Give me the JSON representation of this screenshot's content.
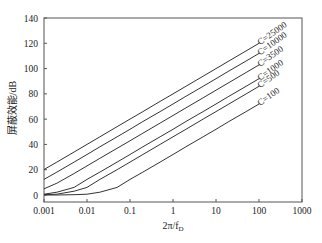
{
  "chart_data": {
    "type": "line",
    "title": "",
    "xlabel": "2π/f_D",
    "xlabel_main": "2π/f",
    "xlabel_sub": "D",
    "ylabel": "屏蔽效能/dB",
    "xscale": "log",
    "xlim": [
      0.001,
      1000
    ],
    "ylim": [
      0,
      140
    ],
    "x_ticks": [
      "0.001",
      "0.01",
      "0.1",
      "1",
      "10",
      "100",
      "1000"
    ],
    "x_tick_values": [
      0.001,
      0.01,
      0.1,
      1,
      10,
      100,
      1000
    ],
    "y_ticks": [
      "0",
      "20",
      "40",
      "60",
      "80",
      "100",
      "120",
      "140"
    ],
    "y_tick_values": [
      0,
      20,
      40,
      60,
      80,
      100,
      120,
      140
    ],
    "grid": false,
    "legend": "inline-labels at line ends (right)",
    "x": [
      0.001,
      0.002,
      0.005,
      0.01,
      0.02,
      0.05,
      0.1,
      0.2,
      0.5,
      1,
      2,
      5,
      10,
      20,
      50,
      100
    ],
    "series": [
      {
        "name": "C=25000",
        "label": "C=25000",
        "values": [
          20.2,
          26.0,
          34.0,
          40.0,
          46.0,
          54.0,
          60.0,
          66.0,
          74.0,
          80.0,
          86.0,
          94.0,
          100.0,
          106.0,
          114.0,
          120.0
        ]
      },
      {
        "name": "C=10000",
        "label": "C=10000",
        "values": [
          12.3,
          18.1,
          26.0,
          32.0,
          38.1,
          46.0,
          52.0,
          58.1,
          66.0,
          72.0,
          78.1,
          86.0,
          92.0,
          98.1,
          106.0,
          112.0
        ]
      },
      {
        "name": "C=3500",
        "label": "C=3500",
        "values": [
          4.9,
          9.3,
          17.0,
          23.0,
          29.0,
          36.9,
          42.9,
          48.9,
          56.9,
          62.9,
          68.9,
          76.9,
          82.9,
          88.9,
          96.9,
          102.9
        ]
      },
      {
        "name": "C=1000",
        "label": "C=1000",
        "values": [
          0.6,
          2.2,
          6.0,
          12.3,
          18.1,
          26.0,
          32.0,
          38.1,
          46.0,
          52.0,
          58.1,
          66.0,
          72.0,
          78.1,
          86.0,
          92.0
        ]
      },
      {
        "name": "C=500",
        "label": "C=500",
        "values": [
          0.2,
          0.6,
          3.0,
          6.0,
          12.3,
          20.0,
          26.0,
          32.0,
          40.0,
          46.0,
          52.0,
          60.0,
          66.0,
          72.0,
          80.0,
          86.0
        ]
      },
      {
        "name": "C=100",
        "label": "C=100",
        "values": [
          0.0,
          0.0,
          0.2,
          0.6,
          2.2,
          6.0,
          12.3,
          18.1,
          26.0,
          32.0,
          38.1,
          46.0,
          52.0,
          58.1,
          66.0,
          72.0
        ]
      }
    ]
  }
}
